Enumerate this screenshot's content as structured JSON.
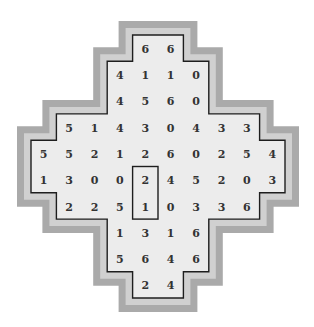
{
  "puzzle": {
    "type": "domino-grid",
    "colors": {
      "outer_band": "#aaaaaa",
      "inner_band": "#d0d0d0",
      "cell_background": "#ececec",
      "grid_line": "#1e1e1e",
      "digit": "#333333"
    },
    "rows": [
      {
        "start_col": 4,
        "values": [
          6,
          6
        ]
      },
      {
        "start_col": 3,
        "values": [
          4,
          1,
          1,
          0
        ]
      },
      {
        "start_col": 3,
        "values": [
          4,
          5,
          6,
          0
        ]
      },
      {
        "start_col": 1,
        "values": [
          5,
          1,
          4,
          3,
          0,
          4,
          3,
          3
        ]
      },
      {
        "start_col": 0,
        "values": [
          5,
          5,
          2,
          1,
          2,
          6,
          0,
          2,
          5,
          4
        ]
      },
      {
        "start_col": 0,
        "values": [
          1,
          3,
          0,
          0,
          2,
          4,
          5,
          2,
          0,
          3
        ]
      },
      {
        "start_col": 1,
        "values": [
          2,
          2,
          5,
          1,
          0,
          3,
          3,
          6
        ]
      },
      {
        "start_col": 3,
        "values": [
          1,
          3,
          1,
          6
        ]
      },
      {
        "start_col": 3,
        "values": [
          5,
          6,
          4,
          6
        ]
      },
      {
        "start_col": 4,
        "values": [
          2,
          4
        ]
      }
    ],
    "highlighted_domino": {
      "col": 4,
      "row": 5,
      "span_rows": 2,
      "values": [
        2,
        1
      ]
    }
  }
}
